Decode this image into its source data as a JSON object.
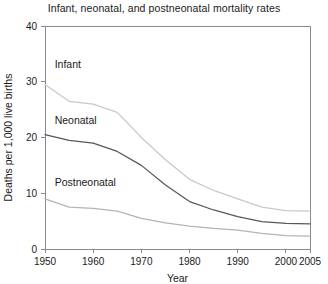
{
  "chart_data": {
    "type": "line",
    "title": "Infant, neonatal, and postneonatal mortality rates",
    "xlabel": "Year",
    "ylabel": "Deaths per 1,000 live births",
    "xlim": [
      1950,
      2005
    ],
    "ylim": [
      0,
      40
    ],
    "grid": false,
    "legend_position": "inline-labels",
    "xticks": [
      1950,
      1960,
      1970,
      1980,
      1990,
      2000,
      2005
    ],
    "xtick_labels": [
      "1950",
      "1960",
      "1970",
      "1980",
      "1990",
      "2000",
      "2005"
    ],
    "yticks": [
      0,
      10,
      20,
      30,
      40
    ],
    "ytick_labels": [
      "0",
      "10",
      "20",
      "30",
      "40"
    ],
    "x": [
      1950,
      1955,
      1960,
      1965,
      1970,
      1975,
      1980,
      1985,
      1990,
      1995,
      2000,
      2005
    ],
    "series": [
      {
        "name": "Infant",
        "color": "#c9c9c9",
        "label_x": 1952,
        "label_y": 32.5,
        "values": [
          29.5,
          26.5,
          26.0,
          24.5,
          20.0,
          16.0,
          12.5,
          10.5,
          9.0,
          7.5,
          6.9,
          6.8
        ]
      },
      {
        "name": "Neonatal",
        "color": "#585858",
        "label_x": 1952,
        "label_y": 22.5,
        "values": [
          20.5,
          19.5,
          19.0,
          17.5,
          15.0,
          11.5,
          8.5,
          7.0,
          5.8,
          4.9,
          4.6,
          4.5
        ]
      },
      {
        "name": "Postneonatal",
        "color": "#b4b4b4",
        "label_x": 1952,
        "label_y": 11.3,
        "values": [
          9.0,
          7.5,
          7.3,
          6.8,
          5.5,
          4.7,
          4.1,
          3.7,
          3.4,
          2.8,
          2.4,
          2.3
        ]
      }
    ]
  }
}
